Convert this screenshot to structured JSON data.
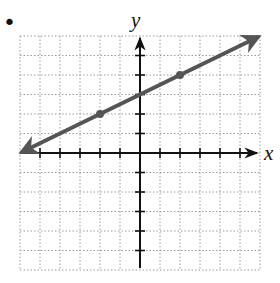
{
  "bullet": "•",
  "chart_data": {
    "type": "line",
    "title": "",
    "xlabel": "x",
    "ylabel": "y",
    "xlim": [
      -6,
      6
    ],
    "ylim": [
      -6,
      6
    ],
    "grid": true,
    "grid_style": "dotted",
    "tick_step": 1,
    "series": [
      {
        "name": "line",
        "equation": "y = 0.5x + 3",
        "slope": 0.5,
        "intercept": 3,
        "x": [
          -6,
          6
        ],
        "y": [
          0,
          6
        ],
        "arrows": "both",
        "color": "#555555"
      }
    ],
    "points": [
      {
        "x": -2,
        "y": 2
      },
      {
        "x": 2,
        "y": 4
      }
    ]
  },
  "colors": {
    "line": "#555555",
    "axis": "#111111",
    "grid": "#9a9a9a"
  }
}
